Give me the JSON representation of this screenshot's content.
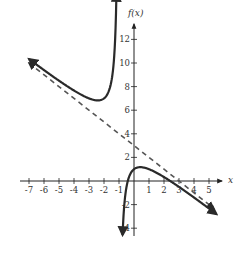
{
  "chart_data": {
    "type": "line",
    "title": "",
    "xlabel": "x",
    "ylabel": "f(x)",
    "xlim": [
      -7.5,
      5.5
    ],
    "ylim": [
      -4.5,
      12.8
    ],
    "grid": false,
    "x_ticks": [
      -7,
      -6,
      -5,
      -4,
      -3,
      -2,
      -1,
      1,
      2,
      3,
      4,
      5
    ],
    "y_ticks": [
      -4,
      -2,
      2,
      4,
      6,
      8,
      10,
      12
    ],
    "series": [
      {
        "name": "f(x) = -x + 3 - 2/(x+1)",
        "style": "solid",
        "color": "#333333",
        "branches": [
          {
            "x_range": [
              -7.0,
              -1.17
            ],
            "note": "left branch, local min near (-2.41, 6.83), rises to +infinity at x=-1"
          },
          {
            "x_range": [
              -0.76,
              5.5
            ],
            "note": "right branch, from -infinity at x=-1, local max near (0.41, 1.17), x-intercepts at -0.41 and 2.41"
          }
        ]
      },
      {
        "name": "slant asymptote y = -x + 3",
        "style": "dashed",
        "color": "#555555",
        "x_range": [
          -7.0,
          5.5
        ]
      }
    ],
    "asymptotes": {
      "vertical": -1,
      "slant": {
        "slope": -1,
        "intercept": 3
      }
    }
  },
  "labels": {
    "x_axis": "x",
    "y_axis": "f(x)"
  }
}
